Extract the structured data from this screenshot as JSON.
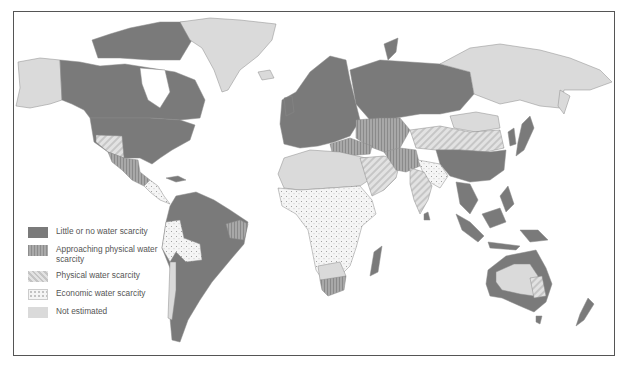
{
  "map": {
    "subject": "Global water scarcity by region",
    "legend": {
      "items": [
        {
          "key": "little",
          "label": "Little or no water scarcity",
          "color": "#7a7a7a",
          "pattern": "solid dark gray"
        },
        {
          "key": "approaching",
          "label": "Approaching physical water scarcity",
          "color": "#9a9a9a",
          "pattern": "vertical stripes"
        },
        {
          "key": "physical",
          "label": "Physical water scarcity",
          "color": "#d4d4d4",
          "pattern": "diagonal stripes"
        },
        {
          "key": "economic",
          "label": "Economic water scarcity",
          "color": "#f4f4f4",
          "pattern": "dots"
        },
        {
          "key": "none",
          "label": "Not estimated",
          "color": "#dadada",
          "pattern": "solid light gray"
        }
      ]
    },
    "regions": [
      {
        "name": "Canada",
        "category": "little"
      },
      {
        "name": "United States (east)",
        "category": "little"
      },
      {
        "name": "United States (southwest)",
        "category": "physical"
      },
      {
        "name": "Mexico (north)",
        "category": "approaching"
      },
      {
        "name": "Alaska",
        "category": "none"
      },
      {
        "name": "Greenland",
        "category": "none"
      },
      {
        "name": "South America (most)",
        "category": "little"
      },
      {
        "name": "Andean region",
        "category": "economic"
      },
      {
        "name": "NE Brazil",
        "category": "approaching"
      },
      {
        "name": "Europe",
        "category": "little"
      },
      {
        "name": "Russia (west)",
        "category": "little"
      },
      {
        "name": "Russia (east)",
        "category": "none"
      },
      {
        "name": "North Africa",
        "category": "none"
      },
      {
        "name": "Sub-Saharan Africa",
        "category": "economic"
      },
      {
        "name": "South Africa",
        "category": "approaching"
      },
      {
        "name": "Madagascar",
        "category": "little"
      },
      {
        "name": "Middle East / Arabia",
        "category": "physical"
      },
      {
        "name": "Central Asia",
        "category": "approaching"
      },
      {
        "name": "Northern China / Mongolia",
        "category": "physical"
      },
      {
        "name": "Southern China",
        "category": "little"
      },
      {
        "name": "India",
        "category": "physical"
      },
      {
        "name": "South Asia (east)",
        "category": "economic"
      },
      {
        "name": "Southeast Asia",
        "category": "little"
      },
      {
        "name": "Australia (coast)",
        "category": "little"
      },
      {
        "name": "Australia (interior)",
        "category": "none"
      },
      {
        "name": "New Zealand",
        "category": "little"
      }
    ]
  }
}
